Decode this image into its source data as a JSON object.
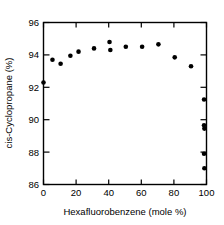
{
  "chart_data": {
    "type": "scatter",
    "title": "",
    "xlabel": "Hexafluorobenzene (mole %)",
    "ylabel": "cis-Cyclopropane (%)",
    "xlim": [
      0,
      100
    ],
    "ylim": [
      86,
      96
    ],
    "xticks": [
      0,
      20,
      40,
      60,
      80,
      100
    ],
    "yticks": [
      86,
      88,
      90,
      92,
      94,
      96
    ],
    "xtick_labels": [
      "0",
      "20",
      "40",
      "60",
      "80",
      "100"
    ],
    "ytick_labels": [
      "86",
      "88",
      "90",
      "92",
      "94",
      "96"
    ],
    "grid": false,
    "legend": null,
    "marker": "filled-circle",
    "marker_color": "#000000",
    "series": [
      {
        "name": "cis-Cyclopropane yield",
        "points": [
          [
            0.0,
            92.3
          ],
          [
            5.5,
            93.7
          ],
          [
            10.5,
            93.45
          ],
          [
            16.5,
            93.95
          ],
          [
            21.5,
            94.2
          ],
          [
            31.0,
            94.4
          ],
          [
            40.5,
            94.8
          ],
          [
            41.0,
            94.3
          ],
          [
            50.5,
            94.5
          ],
          [
            60.5,
            94.5
          ],
          [
            70.5,
            94.65
          ],
          [
            80.5,
            93.85
          ],
          [
            90.5,
            93.3
          ],
          [
            98.5,
            91.25
          ],
          [
            98.5,
            89.65
          ],
          [
            98.7,
            89.45
          ],
          [
            98.5,
            87.9
          ],
          [
            98.7,
            87.0
          ]
        ]
      }
    ]
  }
}
